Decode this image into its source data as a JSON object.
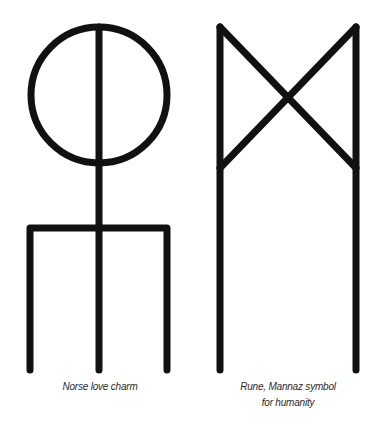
{
  "figures": [
    {
      "id": "norse-love-charm",
      "caption": "Norse love charm"
    },
    {
      "id": "mannaz-rune",
      "caption_line1": "Rune, Mannaz symbol",
      "caption_line2": "for humanity"
    }
  ],
  "colors": {
    "stroke": "#111111",
    "background": "#ffffff",
    "caption": "#2a2a2a"
  }
}
